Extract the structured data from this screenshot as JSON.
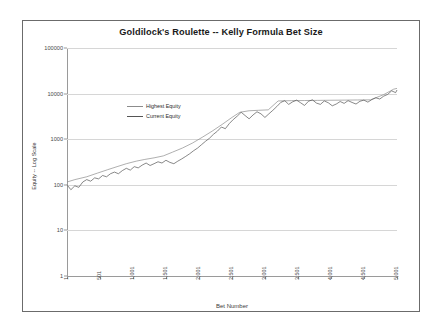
{
  "chart_data": {
    "type": "line",
    "title": "Goldilock's Roulette -- Kelly Formula Bet Size",
    "xlabel": "Bet Number",
    "ylabel": "Equity -- Log Scale",
    "yscale": "log",
    "ylim": [
      1,
      100000
    ],
    "xlim": [
      1,
      5001
    ],
    "grid": true,
    "legend_position": "upper-left-inside",
    "y_ticks": [
      "1",
      "10",
      "100",
      "1000",
      "10000",
      "100000"
    ],
    "y_tick_values": [
      1,
      10,
      100,
      1000,
      10000,
      100000
    ],
    "x_ticks": [
      "1",
      "501",
      "1,001",
      "1,501",
      "2,001",
      "2,501",
      "3,001",
      "3,501",
      "4,001",
      "4,501",
      "5,001"
    ],
    "x_tick_values": [
      1,
      501,
      1001,
      1501,
      2001,
      2501,
      3001,
      3501,
      4001,
      4501,
      5001
    ],
    "legend": [
      "Highest Equity",
      "Current Equity"
    ],
    "series": [
      {
        "name": "Highest Equity",
        "color": "#8c8c8c",
        "x": [
          1,
          120,
          300,
          460,
          620,
          760,
          900,
          1050,
          1180,
          1320,
          1460,
          1600,
          1750,
          1900,
          2050,
          2200,
          2350,
          2500,
          2620,
          2760,
          2900,
          3050,
          3200,
          3400,
          3600,
          3800,
          4000,
          4200,
          4400,
          4600,
          4800,
          4950,
          5001
        ],
        "values": [
          115,
          130,
          150,
          180,
          215,
          250,
          290,
          330,
          360,
          390,
          430,
          520,
          640,
          820,
          1100,
          1500,
          2100,
          3000,
          3900,
          4200,
          4300,
          4400,
          6900,
          7000,
          7050,
          7100,
          7150,
          7200,
          7250,
          7300,
          9500,
          12500,
          13000
        ]
      },
      {
        "name": "Current Equity",
        "color": "#555555",
        "x": [
          1,
          60,
          120,
          180,
          240,
          300,
          360,
          420,
          480,
          540,
          600,
          660,
          720,
          780,
          840,
          900,
          960,
          1020,
          1080,
          1140,
          1200,
          1260,
          1320,
          1380,
          1440,
          1500,
          1560,
          1620,
          1680,
          1740,
          1800,
          1860,
          1920,
          1980,
          2040,
          2100,
          2160,
          2220,
          2280,
          2340,
          2400,
          2460,
          2520,
          2580,
          2640,
          2700,
          2760,
          2820,
          2880,
          2940,
          3000,
          3060,
          3120,
          3180,
          3240,
          3300,
          3360,
          3420,
          3480,
          3540,
          3600,
          3660,
          3720,
          3780,
          3840,
          3900,
          3960,
          4020,
          4080,
          4140,
          4200,
          4260,
          4320,
          4380,
          4440,
          4500,
          4560,
          4620,
          4680,
          4740,
          4800,
          4860,
          4920,
          4980,
          5001
        ],
        "values": [
          100,
          78,
          95,
          88,
          115,
          130,
          120,
          142,
          135,
          160,
          150,
          175,
          190,
          175,
          205,
          230,
          210,
          250,
          235,
          270,
          300,
          265,
          290,
          320,
          300,
          345,
          310,
          290,
          330,
          370,
          420,
          480,
          560,
          640,
          760,
          900,
          1050,
          1280,
          1500,
          1850,
          1700,
          2200,
          2700,
          3200,
          3900,
          3300,
          2800,
          3400,
          4000,
          3600,
          3000,
          3600,
          4300,
          5200,
          6400,
          7000,
          5800,
          6600,
          7200,
          6300,
          5500,
          6800,
          7300,
          6200,
          5800,
          6900,
          6300,
          5400,
          5900,
          6700,
          6100,
          7000,
          6400,
          5900,
          6800,
          7200,
          6500,
          7400,
          8100,
          7600,
          8800,
          9600,
          11500,
          10500,
          12000
        ]
      }
    ]
  }
}
